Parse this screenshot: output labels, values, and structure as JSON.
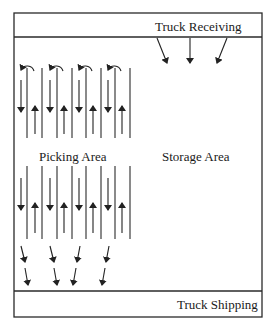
{
  "labels": {
    "truck_receiving": "Truck Receiving",
    "picking_area": "Picking Area",
    "storage_area": "Storage Area",
    "truck_shipping": "Truck Shipping"
  },
  "colors": {
    "line": "#2a2a2a",
    "background": "#ffffff"
  },
  "layout": {
    "outer_box": {
      "x": 14,
      "y": 13,
      "w": 248,
      "h": 304
    },
    "receiving_divider_y": 37,
    "shipping_divider_y": 291,
    "rack_lines_x": [
      27,
      42,
      57,
      72,
      86,
      101,
      115,
      130
    ],
    "receiving_arrows": 3,
    "shipping_arrows": 8,
    "aisle_loops": 4
  }
}
